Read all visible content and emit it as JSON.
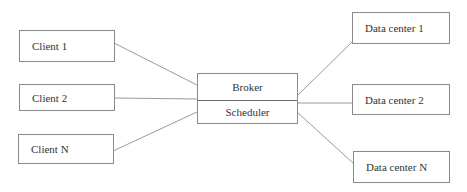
{
  "diagram": {
    "clients": [
      {
        "label": "Client 1"
      },
      {
        "label": "Client 2"
      },
      {
        "label": "Client N"
      }
    ],
    "center": {
      "top_label": "Broker",
      "bottom_label": "Scheduler"
    },
    "data_centers": [
      {
        "label": "Data center 1"
      },
      {
        "label": "Data center 2"
      },
      {
        "label": "Data center N"
      }
    ],
    "colors": {
      "line": "#9a9a9a",
      "border": "#8a8a8a",
      "text": "#333333"
    }
  }
}
